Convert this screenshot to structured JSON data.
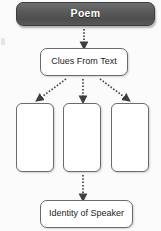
{
  "diagram": {
    "type": "flowchart",
    "background_color": "#fbfbfb",
    "nodes": [
      {
        "id": "poem",
        "label": "Poem",
        "style": "header",
        "fill_color": "#575757",
        "text_color": "#ffffff",
        "bold": true
      },
      {
        "id": "clues",
        "label": "Clues From Text",
        "style": "plain",
        "fill_color": "#ffffff",
        "text_color": "#1d1d1d",
        "bold": false
      },
      {
        "id": "blank-1",
        "label": "",
        "style": "plain-blank",
        "fill_color": "#ffffff",
        "text_color": "#1d1d1d",
        "bold": false
      },
      {
        "id": "blank-2",
        "label": "",
        "style": "plain-blank",
        "fill_color": "#ffffff",
        "text_color": "#1d1d1d",
        "bold": false
      },
      {
        "id": "blank-3",
        "label": "",
        "style": "plain-blank",
        "fill_color": "#ffffff",
        "text_color": "#1d1d1d",
        "bold": false
      },
      {
        "id": "identity",
        "label": "Identity of Speaker",
        "style": "plain",
        "fill_color": "#ffffff",
        "text_color": "#1d1d1d",
        "bold": false
      }
    ],
    "connectors": [
      {
        "from": "poem",
        "to": "clues",
        "style": "dotted",
        "arrowhead": "filled-triangle",
        "color": "#4a4a4a"
      },
      {
        "from": "clues",
        "to": "blank-1",
        "style": "dotted",
        "arrowhead": "filled-triangle",
        "color": "#4a4a4a"
      },
      {
        "from": "clues",
        "to": "blank-2",
        "style": "dotted",
        "arrowhead": "filled-triangle",
        "color": "#4a4a4a"
      },
      {
        "from": "clues",
        "to": "blank-3",
        "style": "dotted",
        "arrowhead": "filled-triangle",
        "color": "#4a4a4a"
      },
      {
        "from": "blank-2",
        "to": "identity",
        "style": "dotted",
        "arrowhead": "filled-triangle",
        "color": "#4a4a4a"
      }
    ]
  }
}
